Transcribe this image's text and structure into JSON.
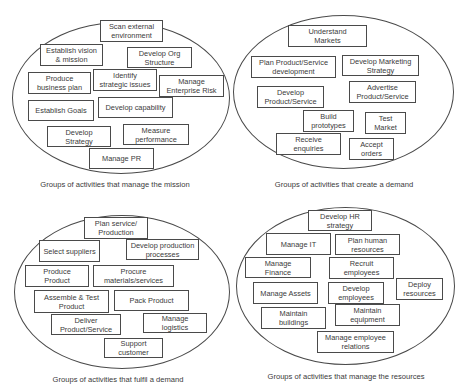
{
  "groups": [
    {
      "caption": "Groups of activities that manage  the mission",
      "activities": [
        "Scan external\nenvironment",
        "Establish vision\n& mission",
        "Develop Org\nStructure",
        "Produce\nbusiness plan",
        "Identify\nstrategic issues",
        "Manage\nEnterprise Risk",
        "Establish Goals",
        "Develop capability",
        "Develop\nStrategy",
        "Measure\nperformance",
        "Manage PR"
      ]
    },
    {
      "caption": "Groups of activities that create a demand",
      "activities": [
        "Understand\nMarkets",
        "Plan Product/Service\ndevelopment",
        "Develop Marketing\nStrategy",
        "Develop\nProduct/Service",
        "Advertise\nProduct/Service",
        "Build\nprototypes",
        "Test\nMarket",
        "Receive\nenquiries",
        "Accept\norders"
      ]
    },
    {
      "caption": "Groups of activities that fulfil a demand",
      "activities": [
        "Plan service/\nProduction",
        "Select suppliers",
        "Develop production\nprocesses",
        "Produce\nProduct",
        "Procure\nmaterials/services",
        "Assemble & Test\nProduct",
        "Pack Product",
        "Deliver\nProduct/Service",
        "Manage\nlogistics",
        "Support\ncustomer"
      ]
    },
    {
      "caption": "Groups of activities that manage the resources",
      "activities": [
        "Develop HR\nstrategy",
        "Manage IT",
        "Plan human\nresources",
        "Manage\nFinance",
        "Recruit\nemployees",
        "Manage Assets",
        "Develop\nemployees",
        "Deploy\nresources",
        "Maintain\nbuildings",
        "Maintain\nequipment",
        "Manage employee\nrelations"
      ]
    }
  ]
}
